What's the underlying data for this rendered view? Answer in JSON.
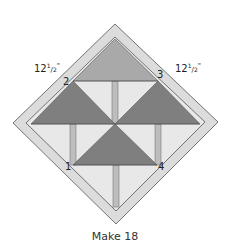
{
  "diagram": {
    "dimension_labels": {
      "left": {
        "whole": "12",
        "num": "1",
        "den": "2",
        "unit": "\""
      },
      "right": {
        "whole": "12",
        "num": "1",
        "den": "2",
        "unit": "\""
      }
    },
    "corner_numbers": [
      "1",
      "2",
      "3",
      "4"
    ],
    "caption": "Make 18",
    "colors": {
      "border": "#dcdcdc",
      "background": "#e6e6e6",
      "top_triangle": "#aaaaaa",
      "dark_triangle": "#7f7f7f",
      "trunk": "#bdbdbd",
      "outline": "#555555"
    }
  }
}
